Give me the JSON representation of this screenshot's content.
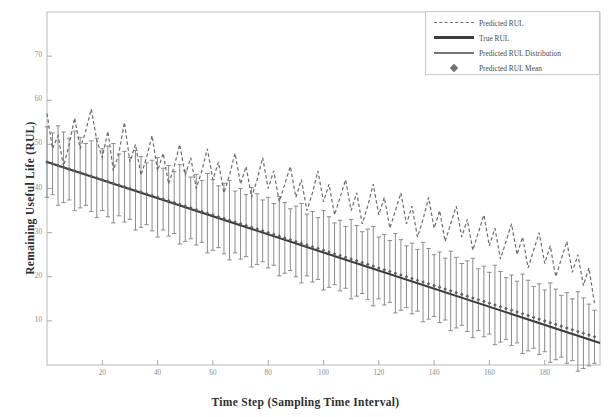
{
  "chart_data": {
    "type": "line",
    "title": "",
    "xlabel": "Time Step (Sampling Time Interval)",
    "ylabel": "Remaining Useful Life (RUL)",
    "xlim": [
      0,
      200
    ],
    "ylim": [
      0,
      80
    ],
    "grid": false,
    "legend_position": "top-right",
    "xticks": [
      20,
      40,
      60,
      80,
      100,
      120,
      140,
      160,
      180
    ],
    "xtick_labels": [
      "20",
      "40",
      "60",
      "80",
      "100",
      "120",
      "140",
      "160",
      "180"
    ],
    "yticks": [
      10,
      20,
      30,
      40,
      50,
      60,
      70
    ],
    "ytick_labels": [
      "10",
      "20",
      "30",
      "40",
      "50",
      "60",
      "70"
    ],
    "legend": [
      {
        "label": "Predicted RUL",
        "style": "dashed-line",
        "color": "#6b6b6b"
      },
      {
        "label": "True RUL",
        "style": "solid-thick-line",
        "color": "#3d3d3d"
      },
      {
        "label": "Predicted RUL Distribution",
        "style": "solid-medium-line",
        "color": "#777777"
      },
      {
        "label": "Predicted RUL Mean",
        "style": "diamond-marker",
        "color": "#6f6f6f"
      }
    ],
    "series": [
      {
        "name": "True RUL",
        "x": [
          0,
          200
        ],
        "values": [
          46,
          5
        ]
      },
      {
        "name": "Predicted RUL",
        "x": [
          0,
          2,
          4,
          6,
          8,
          10,
          12,
          14,
          16,
          18,
          20,
          22,
          24,
          26,
          28,
          30,
          32,
          34,
          36,
          38,
          40,
          42,
          44,
          46,
          48,
          50,
          52,
          54,
          56,
          58,
          60,
          62,
          64,
          66,
          68,
          70,
          72,
          74,
          76,
          78,
          80,
          82,
          84,
          86,
          88,
          90,
          92,
          94,
          96,
          98,
          100,
          102,
          104,
          106,
          108,
          110,
          112,
          114,
          116,
          118,
          120,
          122,
          124,
          126,
          128,
          130,
          132,
          134,
          136,
          138,
          140,
          142,
          144,
          146,
          148,
          150,
          152,
          154,
          156,
          158,
          160,
          162,
          164,
          166,
          168,
          170,
          172,
          174,
          176,
          178,
          180,
          182,
          184,
          186,
          188,
          190,
          192,
          194,
          196,
          198
        ],
        "values": [
          57,
          49,
          52,
          45,
          50,
          56,
          49,
          53,
          58,
          51,
          47,
          53,
          44,
          48,
          55,
          46,
          50,
          43,
          47,
          52,
          44,
          48,
          41,
          45,
          50,
          43,
          47,
          40,
          44,
          49,
          42,
          46,
          39,
          43,
          48,
          41,
          45,
          38,
          42,
          47,
          40,
          44,
          37,
          41,
          45,
          38,
          42,
          35,
          39,
          44,
          37,
          41,
          34,
          38,
          42,
          35,
          39,
          32,
          36,
          41,
          34,
          38,
          31,
          35,
          39,
          32,
          36,
          29,
          33,
          38,
          31,
          35,
          28,
          32,
          36,
          29,
          33,
          26,
          30,
          34,
          27,
          31,
          24,
          28,
          32,
          25,
          29,
          22,
          26,
          30,
          23,
          27,
          20,
          24,
          28,
          21,
          25,
          18,
          22,
          14
        ]
      },
      {
        "name": "Predicted RUL Mean",
        "x": [
          0,
          2,
          4,
          6,
          8,
          10,
          12,
          14,
          16,
          18,
          20,
          22,
          24,
          26,
          28,
          30,
          32,
          34,
          36,
          38,
          40,
          42,
          44,
          46,
          48,
          50,
          52,
          54,
          56,
          58,
          60,
          62,
          64,
          66,
          68,
          70,
          72,
          74,
          76,
          78,
          80,
          82,
          84,
          86,
          88,
          90,
          92,
          94,
          96,
          98,
          100,
          102,
          104,
          106,
          108,
          110,
          112,
          114,
          116,
          118,
          120,
          122,
          124,
          126,
          128,
          130,
          132,
          134,
          136,
          138,
          140,
          142,
          144,
          146,
          148,
          150,
          152,
          154,
          156,
          158,
          160,
          162,
          164,
          166,
          168,
          170,
          172,
          174,
          176,
          178,
          180,
          182,
          184,
          186,
          188,
          190,
          192,
          194,
          196,
          198
        ],
        "values": [
          46.0,
          45.6,
          45.2,
          44.8,
          44.4,
          44.0,
          43.6,
          43.2,
          42.8,
          42.4,
          42.0,
          41.6,
          41.2,
          40.8,
          40.4,
          40.0,
          39.6,
          39.2,
          38.8,
          38.4,
          38.0,
          37.6,
          37.2,
          36.8,
          36.4,
          36.0,
          35.6,
          35.2,
          34.8,
          34.4,
          34.0,
          33.6,
          33.2,
          32.8,
          32.4,
          32.0,
          31.6,
          31.2,
          30.8,
          30.4,
          30.0,
          29.6,
          29.2,
          28.8,
          28.4,
          28.0,
          27.6,
          27.2,
          26.8,
          26.4,
          26.0,
          25.6,
          25.2,
          24.8,
          24.4,
          24.0,
          23.6,
          23.2,
          22.8,
          22.4,
          22.0,
          21.6,
          21.2,
          20.8,
          20.4,
          20.0,
          19.6,
          19.2,
          18.8,
          18.4,
          18.0,
          17.6,
          17.2,
          16.8,
          16.4,
          16.0,
          15.6,
          15.2,
          14.8,
          14.4,
          14.0,
          13.6,
          13.2,
          12.8,
          12.4,
          12.0,
          11.6,
          11.2,
          10.8,
          10.4,
          10.0,
          9.6,
          9.2,
          8.8,
          8.4,
          8.0,
          7.6,
          7.2,
          6.8,
          6.4
        ]
      },
      {
        "name": "Predicted RUL Distribution",
        "description": "vertical error bars around Predicted RUL Mean",
        "x": [
          0,
          2,
          4,
          6,
          8,
          10,
          12,
          14,
          16,
          18,
          20,
          22,
          24,
          26,
          28,
          30,
          32,
          34,
          36,
          38,
          40,
          42,
          44,
          46,
          48,
          50,
          52,
          54,
          56,
          58,
          60,
          62,
          64,
          66,
          68,
          70,
          72,
          74,
          76,
          78,
          80,
          82,
          84,
          86,
          88,
          90,
          92,
          94,
          96,
          98,
          100,
          102,
          104,
          106,
          108,
          110,
          112,
          114,
          116,
          118,
          120,
          122,
          124,
          126,
          128,
          130,
          132,
          134,
          136,
          138,
          140,
          142,
          144,
          146,
          148,
          150,
          152,
          154,
          156,
          158,
          160,
          162,
          164,
          166,
          168,
          170,
          172,
          174,
          176,
          178,
          180,
          182,
          184,
          186,
          188,
          190,
          192,
          194,
          196,
          198
        ],
        "half_width": [
          8,
          7,
          9,
          8,
          7,
          9,
          8,
          7,
          8,
          9,
          7,
          8,
          9,
          7,
          8,
          7,
          9,
          8,
          7,
          8,
          9,
          7,
          8,
          7,
          9,
          8,
          7,
          8,
          7,
          9,
          8,
          7,
          8,
          9,
          7,
          8,
          7,
          9,
          8,
          7,
          8,
          7,
          9,
          8,
          7,
          8,
          9,
          7,
          8,
          7,
          9,
          8,
          7,
          8,
          7,
          9,
          8,
          7,
          8,
          9,
          7,
          8,
          7,
          9,
          8,
          7,
          8,
          7,
          9,
          8,
          7,
          8,
          7,
          9,
          8,
          7,
          8,
          9,
          7,
          8,
          7,
          9,
          8,
          7,
          8,
          7,
          9,
          8,
          7,
          8,
          7,
          9,
          8,
          7,
          8,
          7,
          9,
          8,
          7,
          6
        ]
      }
    ]
  }
}
